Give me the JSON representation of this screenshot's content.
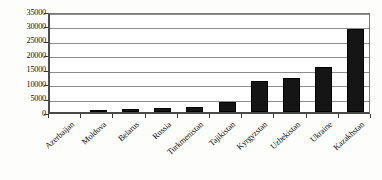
{
  "chart_data": {
    "type": "bar",
    "title": "",
    "subtitle": "",
    "xlabel": "",
    "ylabel": "",
    "ylim": [
      0,
      35000
    ],
    "ytick_values": [
      0,
      5000,
      10000,
      15000,
      20000,
      25000,
      30000,
      35000
    ],
    "ytick_labels": [
      "0",
      "5000",
      "10000",
      "15000",
      "20000",
      "25000",
      "30000",
      "35000"
    ],
    "grid": true,
    "legend": false,
    "legend_position": "none",
    "bar_color": "#151515",
    "categories": [
      "Azerbaijan",
      "Moldova",
      "Belarus",
      "Russia",
      "Turkmenistan",
      "Tajikistan",
      "Kyrgyzstan",
      "Uzbekistan",
      "Ukraine",
      "Kazakhstan"
    ],
    "values": [
      60,
      800,
      950,
      1300,
      1600,
      3400,
      10800,
      11900,
      15600,
      28900
    ],
    "annotations": []
  },
  "axes": {
    "y_axis_name": "value-axis",
    "x_axis_name": "category-axis"
  }
}
